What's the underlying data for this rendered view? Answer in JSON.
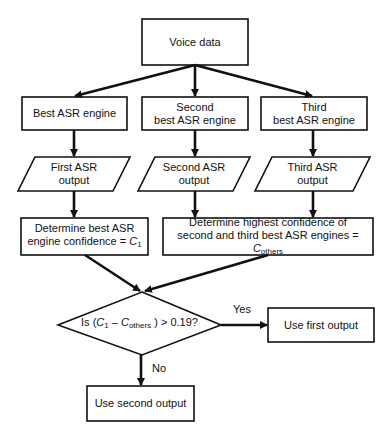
{
  "diagram": {
    "type": "flowchart",
    "stroke_color": "#111111",
    "background": "#ffffff",
    "nodes": {
      "voice_data": {
        "shape": "rectangle",
        "lines": [
          "Voice data"
        ]
      },
      "best_engine": {
        "shape": "rectangle",
        "lines": [
          "Best ASR engine"
        ]
      },
      "second_engine": {
        "shape": "rectangle",
        "lines": [
          "Second",
          "best ASR engine"
        ]
      },
      "third_engine": {
        "shape": "rectangle",
        "lines": [
          "Third",
          "best ASR engine"
        ]
      },
      "first_output": {
        "shape": "parallelogram",
        "lines": [
          "First ASR",
          "output"
        ]
      },
      "second_output": {
        "shape": "parallelogram",
        "lines": [
          "Second ASR",
          "output"
        ]
      },
      "third_output": {
        "shape": "parallelogram",
        "lines": [
          "Third ASR",
          "output"
        ]
      },
      "determine_best": {
        "shape": "rectangle",
        "line1": "Determine best ASR",
        "line2_prefix": "engine confidence = ",
        "var": "C",
        "var_sub": "1"
      },
      "determine_others": {
        "shape": "rectangle",
        "line1": "Determine highest confidence of",
        "line2_prefix": "second and third best ASR engines = ",
        "var": "C",
        "var_sub": "others"
      },
      "decision": {
        "shape": "diamond",
        "prefix": "Is (",
        "var1": "C",
        "var1_sub": "1",
        "minus": " – ",
        "var2": "C",
        "var2_sub": "others",
        "suffix": " ) > 0.19?"
      },
      "use_first": {
        "shape": "rectangle",
        "lines": [
          "Use first output"
        ]
      },
      "use_second": {
        "shape": "rectangle",
        "lines": [
          "Use second output"
        ]
      }
    },
    "edges": [
      {
        "from": "voice_data",
        "to": "best_engine"
      },
      {
        "from": "voice_data",
        "to": "second_engine"
      },
      {
        "from": "voice_data",
        "to": "third_engine"
      },
      {
        "from": "best_engine",
        "to": "first_output"
      },
      {
        "from": "second_engine",
        "to": "second_output"
      },
      {
        "from": "third_engine",
        "to": "third_output"
      },
      {
        "from": "first_output",
        "to": "determine_best"
      },
      {
        "from": "second_output",
        "to": "determine_others"
      },
      {
        "from": "third_output",
        "to": "determine_others"
      },
      {
        "from": "determine_best",
        "to": "decision"
      },
      {
        "from": "determine_others",
        "to": "decision"
      },
      {
        "from": "decision",
        "to": "use_first",
        "label": "Yes"
      },
      {
        "from": "decision",
        "to": "use_second",
        "label": "No"
      }
    ],
    "edge_labels": {
      "yes": "Yes",
      "no": "No"
    }
  }
}
